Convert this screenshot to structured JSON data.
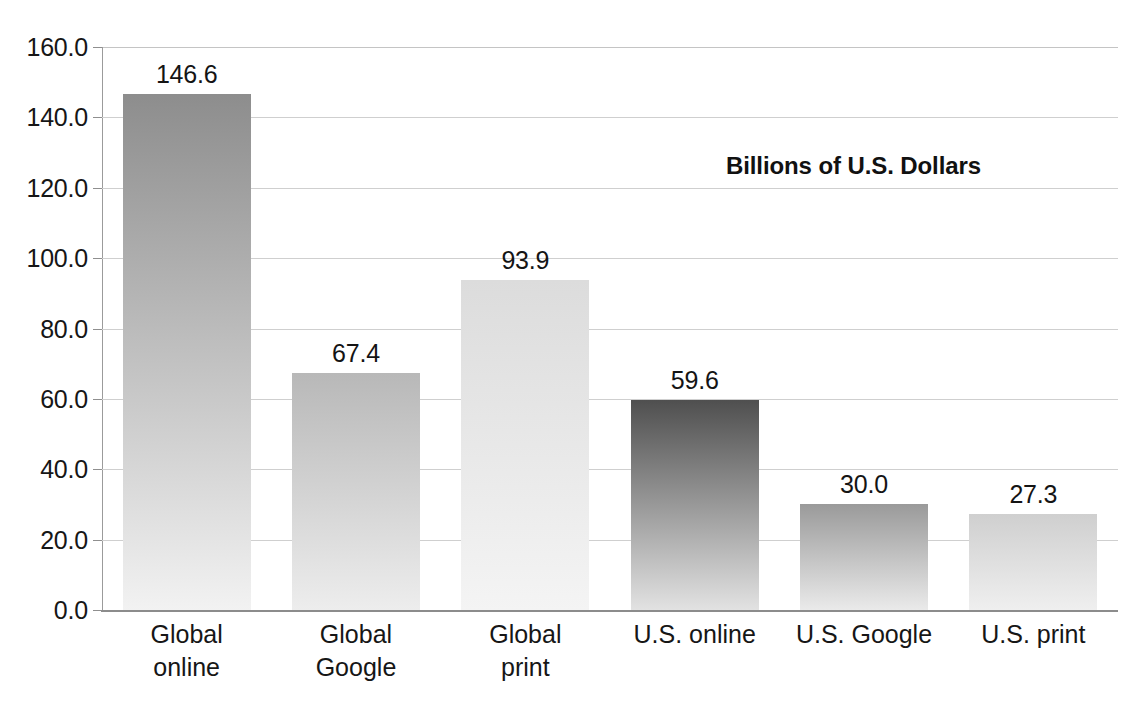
{
  "chart_data": {
    "type": "bar",
    "title": "",
    "subtitle": "",
    "xlabel": "",
    "ylabel": "",
    "annotation": "Billions of U.S. Dollars",
    "categories": [
      "Global\nonline",
      "Global\nGoogle",
      "Global\nprint",
      "U.S. online",
      "U.S. Google",
      "U.S. print"
    ],
    "category_lines": [
      [
        "Global",
        "online"
      ],
      [
        "Global",
        "Google"
      ],
      [
        "Global",
        "print"
      ],
      [
        "U.S. online"
      ],
      [
        "U.S. Google"
      ],
      [
        "U.S. print"
      ]
    ],
    "values": [
      146.6,
      67.4,
      93.9,
      59.6,
      30.0,
      27.3
    ],
    "value_labels": [
      "146.6",
      "67.4",
      "93.9",
      "59.6",
      "30.0",
      "27.3"
    ],
    "ylim": [
      0,
      160
    ],
    "ytick_step": 20,
    "ytick_labels": [
      "0.0",
      "20.0",
      "40.0",
      "60.0",
      "80.0",
      "100.0",
      "120.0",
      "140.0",
      "160.0"
    ],
    "ytick_values": [
      0,
      20,
      40,
      60,
      80,
      100,
      120,
      140,
      160
    ],
    "grid": true,
    "legend": false,
    "bar_top_colors": [
      "#8d8d8d",
      "#b8b8b8",
      "#dcdcdc",
      "#4f4f4f",
      "#9a9a9a",
      "#cfcfcf"
    ],
    "bar_bottom_colors": [
      "#f2f2f2",
      "#ededed",
      "#f4f4f4",
      "#e2e2e2",
      "#eaeaea",
      "#efefef"
    ],
    "background_color": "#ffffff",
    "grid_color": "#cfcfcf",
    "axis_color": "#8c8c8c",
    "text_color": "#161616"
  }
}
